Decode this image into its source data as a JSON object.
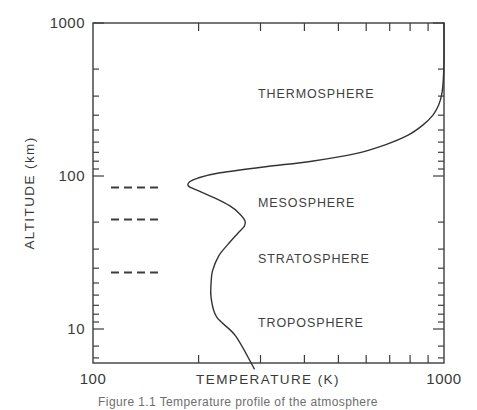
{
  "chart_data": {
    "type": "line",
    "title": "",
    "xlabel": "TEMPERATURE (K)",
    "ylabel": "ALTITUDE (km)",
    "xscale": "log",
    "yscale": "log",
    "xlim": [
      100,
      1000
    ],
    "ylim": [
      6,
      1000
    ],
    "grid": false,
    "legend": "none",
    "x_tick_labels": [
      "100",
      "1000"
    ],
    "x_tick_values": [
      100,
      1000
    ],
    "x_minor_ticks": [
      200,
      300,
      400,
      500,
      600,
      700,
      800,
      900
    ],
    "y_tick_labels": [
      "10",
      "100",
      "1000"
    ],
    "y_tick_values": [
      10,
      100,
      1000
    ],
    "y_minor_ticks": [
      7,
      8,
      9,
      20,
      30,
      40,
      50,
      60,
      70,
      80,
      90,
      200,
      300,
      400,
      500,
      600,
      700,
      800,
      900
    ],
    "series": [
      {
        "name": "U.S. Standard Atmosphere temperature profile",
        "points": [
          {
            "temperature": 288,
            "altitude": 5.5
          },
          {
            "temperature": 255,
            "altitude": 9.0
          },
          {
            "temperature": 225,
            "altitude": 12.0
          },
          {
            "temperature": 217,
            "altitude": 16.0
          },
          {
            "temperature": 217,
            "altitude": 20.0
          },
          {
            "temperature": 219,
            "altitude": 24.0
          },
          {
            "temperature": 228,
            "altitude": 30.0
          },
          {
            "temperature": 243,
            "altitude": 36.0
          },
          {
            "temperature": 258,
            "altitude": 42.0
          },
          {
            "temperature": 270,
            "altitude": 47.0
          },
          {
            "temperature": 271,
            "altitude": 51.0
          },
          {
            "temperature": 261,
            "altitude": 57.0
          },
          {
            "temperature": 245,
            "altitude": 64.0
          },
          {
            "temperature": 222,
            "altitude": 72.0
          },
          {
            "temperature": 200,
            "altitude": 80.0
          },
          {
            "temperature": 187,
            "altitude": 86.0
          },
          {
            "temperature": 189,
            "altitude": 92.0
          },
          {
            "temperature": 199,
            "altitude": 97.0
          },
          {
            "temperature": 230,
            "altitude": 105.0
          },
          {
            "temperature": 310,
            "altitude": 115.0
          },
          {
            "temperature": 420,
            "altitude": 125.0
          },
          {
            "temperature": 560,
            "altitude": 140.0
          },
          {
            "temperature": 680,
            "altitude": 160.0
          },
          {
            "temperature": 790,
            "altitude": 185.0
          },
          {
            "temperature": 870,
            "altitude": 215.0
          },
          {
            "temperature": 930,
            "altitude": 250.0
          },
          {
            "temperature": 965,
            "altitude": 290.0
          },
          {
            "temperature": 985,
            "altitude": 340.0
          },
          {
            "temperature": 995,
            "altitude": 420.0
          },
          {
            "temperature": 1000,
            "altitude": 560.0
          },
          {
            "temperature": 1000,
            "altitude": 1000.0
          }
        ]
      }
    ],
    "boundary_markers": [
      {
        "name": "mesopause",
        "altitude": 86,
        "label": ""
      },
      {
        "name": "stratopause",
        "altitude": 51,
        "label": ""
      },
      {
        "name": "tropopause",
        "altitude": 19,
        "label": ""
      }
    ],
    "annotations": [
      {
        "name": "thermosphere-label",
        "text": "THERMOSPHERE",
        "temperature": 380,
        "altitude": 330
      },
      {
        "name": "mesosphere-label",
        "text": "MESOSPHERE",
        "temperature": 380,
        "altitude": 62
      },
      {
        "name": "stratosphere-label",
        "text": "STRATOSPHERE",
        "temperature": 380,
        "altitude": 27
      },
      {
        "name": "troposphere-label",
        "text": "TROPOSPHERE",
        "temperature": 380,
        "altitude": 9.5
      }
    ]
  },
  "axes": {
    "x_title": "TEMPERATURE (K)",
    "y_title": "ALTITUDE (km)",
    "x_label_left": "100",
    "x_label_right": "1000",
    "y_label_bottom": "10",
    "y_label_middle": "100",
    "y_label_top": "1000"
  },
  "regions": {
    "thermosphere": "THERMOSPHERE",
    "mesosphere": "MESOSPHERE",
    "stratosphere": "STRATOSPHERE",
    "troposphere": "TROPOSPHERE"
  },
  "caption": {
    "text": "Figure 1.1  Temperature profile of the atmosphere"
  },
  "colors": {
    "background": "#ffffff",
    "line": "#333333",
    "axis": "#3c3c3c",
    "text": "#3a3a3a",
    "caption": "#6e6e6e"
  }
}
